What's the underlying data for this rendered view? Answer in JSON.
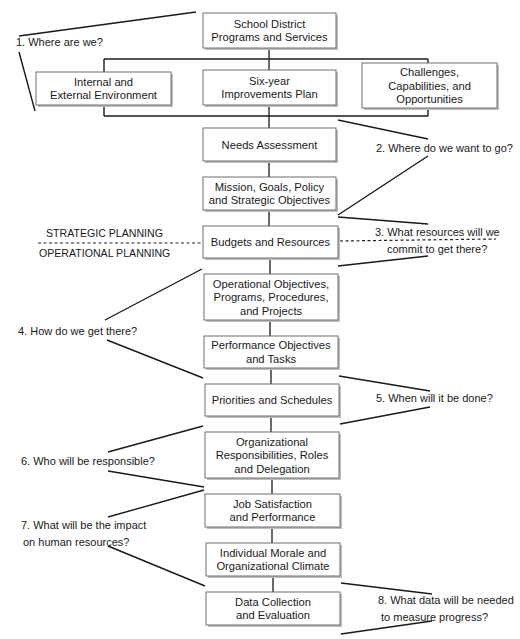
{
  "diagram": {
    "boxes": [
      {
        "id": "school-district",
        "lines": [
          "School District",
          "Programs and Services"
        ],
        "x": 203,
        "y": 13,
        "w": 133,
        "h": 35
      },
      {
        "id": "internal-external",
        "lines": [
          "Internal and",
          "External Environment"
        ],
        "x": 36,
        "y": 72,
        "w": 135,
        "h": 33
      },
      {
        "id": "six-year",
        "lines": [
          "Six-year",
          "Improvements Plan"
        ],
        "x": 203,
        "y": 70,
        "w": 133,
        "h": 35
      },
      {
        "id": "challenges",
        "lines": [
          "Challenges,",
          "Capabilities, and",
          "Opportunities"
        ],
        "x": 362,
        "y": 63,
        "w": 135,
        "h": 45
      },
      {
        "id": "needs-assessment",
        "lines": [
          "Needs Assessment"
        ],
        "x": 203,
        "y": 128,
        "w": 133,
        "h": 33
      },
      {
        "id": "mission-goals",
        "lines": [
          "Mission, Goals, Policy",
          "and Strategic Objectives"
        ],
        "x": 203,
        "y": 177,
        "w": 133,
        "h": 33
      },
      {
        "id": "budgets-resources",
        "lines": [
          "Budgets and Resources"
        ],
        "x": 203,
        "y": 226,
        "w": 135,
        "h": 32
      },
      {
        "id": "operational-objectives",
        "lines": [
          "Operational Objectives,",
          "Programs, Procedures,",
          "and Projects"
        ],
        "x": 204,
        "y": 274,
        "w": 134,
        "h": 46
      },
      {
        "id": "performance-objectives",
        "lines": [
          "Performance Objectives",
          "and Tasks"
        ],
        "x": 204,
        "y": 336,
        "w": 134,
        "h": 32
      },
      {
        "id": "priorities-schedules",
        "lines": [
          "Priorities and Schedules"
        ],
        "x": 205,
        "y": 384,
        "w": 134,
        "h": 32
      },
      {
        "id": "organizational-responsibilities",
        "lines": [
          "Organizational",
          "Responsibilities, Roles",
          "and Delegation"
        ],
        "x": 205,
        "y": 432,
        "w": 134,
        "h": 46
      },
      {
        "id": "job-satisfaction",
        "lines": [
          "Job Satisfaction",
          "and Performance"
        ],
        "x": 205,
        "y": 494,
        "w": 135,
        "h": 33
      },
      {
        "id": "individual-morale",
        "lines": [
          "Individual Morale and",
          "Organizational Climate"
        ],
        "x": 206,
        "y": 543,
        "w": 134,
        "h": 33
      },
      {
        "id": "data-collection",
        "lines": [
          "Data Collection",
          "and Evaluation"
        ],
        "x": 206,
        "y": 592,
        "w": 134,
        "h": 33
      }
    ],
    "planning_labels": {
      "strategic": "STRATEGIC PLANNING",
      "operational": "OPERATIONAL PLANNING"
    },
    "questions": [
      {
        "id": "q1",
        "side": "left",
        "lines": [
          "1. Where are we?"
        ],
        "x": 16,
        "y": 46
      },
      {
        "id": "q2",
        "side": "right",
        "lines": [
          "2. Where do we want to go?"
        ],
        "x": 376,
        "y": 152
      },
      {
        "id": "q3",
        "side": "right",
        "lines": [
          "3. What resources will we",
          "commit to get there?"
        ],
        "x": 375,
        "y": 236,
        "indent": 12
      },
      {
        "id": "q4",
        "side": "left",
        "lines": [
          "4. How do we get there?"
        ],
        "x": 18,
        "y": 335
      },
      {
        "id": "q5",
        "side": "right",
        "lines": [
          "5. When will it be done?"
        ],
        "x": 376,
        "y": 402
      },
      {
        "id": "q6",
        "side": "left",
        "lines": [
          "6. Who will be responsible?"
        ],
        "x": 21,
        "y": 465
      },
      {
        "id": "q7",
        "side": "left",
        "lines": [
          "7. What will be the impact",
          "on human resources?"
        ],
        "x": 21,
        "y": 529,
        "indent": 2
      },
      {
        "id": "q8",
        "side": "right",
        "lines": [
          "8. What data will be needed",
          "to measure progress?"
        ],
        "x": 378,
        "y": 604,
        "indent": 3
      }
    ]
  }
}
